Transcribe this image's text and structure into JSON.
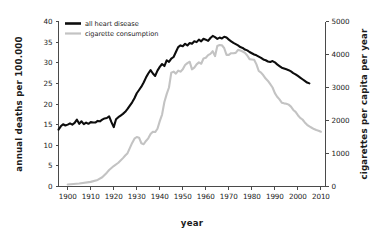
{
  "chart_data": {
    "type": "line",
    "title": "",
    "xlabel": "year",
    "ylabel": "annual deaths per 100.000",
    "y2label": "cigarettes per capita per year",
    "xlim": [
      1896,
      2012
    ],
    "ylim": [
      0,
      40
    ],
    "y2lim": [
      0,
      5000
    ],
    "grid": false,
    "legend_position": "top-left",
    "xticks": [
      "1900",
      "1910",
      "1920",
      "1930",
      "1940",
      "1950",
      "1960",
      "1970",
      "1980",
      "1990",
      "2000",
      "2010"
    ],
    "xtick_values": [
      1900,
      1910,
      1920,
      1930,
      1940,
      1950,
      1960,
      1970,
      1980,
      1990,
      2000,
      2010
    ],
    "yticks": [
      "0",
      "5",
      "10",
      "15",
      "20",
      "25",
      "30",
      "35",
      "40"
    ],
    "ytick_values": [
      0,
      5,
      10,
      15,
      20,
      25,
      30,
      35,
      40
    ],
    "y2ticks": [
      "0",
      "1000",
      "2000",
      "3000",
      "4000",
      "5000"
    ],
    "y2tick_values": [
      0,
      1000,
      2000,
      3000,
      4000,
      5000
    ],
    "series": [
      {
        "name": "all heart disease",
        "axis": "left",
        "color": "#0d0d0d",
        "x": [
          1896,
          1897,
          1898,
          1899,
          1900,
          1901,
          1902,
          1903,
          1904,
          1905,
          1906,
          1907,
          1908,
          1909,
          1910,
          1911,
          1912,
          1913,
          1914,
          1915,
          1916,
          1917,
          1918,
          1919,
          1920,
          1921,
          1922,
          1923,
          1924,
          1925,
          1926,
          1927,
          1928,
          1929,
          1930,
          1931,
          1932,
          1933,
          1934,
          1935,
          1936,
          1937,
          1938,
          1939,
          1940,
          1941,
          1942,
          1943,
          1944,
          1945,
          1946,
          1947,
          1948,
          1949,
          1950,
          1951,
          1952,
          1953,
          1954,
          1955,
          1956,
          1957,
          1958,
          1959,
          1960,
          1961,
          1962,
          1963,
          1964,
          1965,
          1966,
          1967,
          1968,
          1969,
          1970,
          1971,
          1972,
          1973,
          1974,
          1975,
          1976,
          1977,
          1978,
          1979,
          1980,
          1981,
          1982,
          1983,
          1984,
          1985,
          1986,
          1987,
          1988,
          1989,
          1990,
          1991,
          1992,
          1993,
          1994,
          1995,
          1996,
          1997,
          1998,
          1999,
          2000,
          2001,
          2002,
          2003,
          2004,
          2005
        ],
        "y": [
          13.8,
          14.6,
          15.1,
          14.8,
          15.0,
          15.3,
          15.0,
          15.4,
          16.2,
          15.2,
          15.8,
          15.1,
          15.5,
          15.2,
          15.6,
          15.5,
          15.5,
          15.9,
          15.8,
          16.2,
          16.5,
          16.6,
          17.0,
          15.6,
          14.4,
          16.3,
          16.8,
          17.2,
          17.6,
          18.1,
          18.8,
          19.6,
          20.4,
          21.4,
          22.6,
          23.4,
          24.2,
          25.2,
          26.4,
          27.4,
          28.2,
          27.4,
          26.8,
          28.1,
          29.0,
          29.7,
          29.2,
          30.6,
          30.2,
          31.0,
          31.4,
          32.6,
          33.8,
          34.2,
          34.0,
          34.6,
          34.2,
          34.8,
          34.6,
          35.2,
          35.0,
          35.6,
          35.2,
          35.8,
          35.6,
          35.3,
          36.0,
          36.5,
          36.2,
          35.8,
          36.1,
          35.9,
          36.3,
          36.1,
          35.6,
          35.2,
          34.8,
          34.5,
          34.2,
          33.8,
          33.6,
          33.2,
          33.0,
          32.6,
          32.3,
          32.0,
          31.8,
          31.5,
          31.2,
          30.8,
          30.6,
          30.3,
          30.2,
          30.4,
          30.1,
          29.6,
          29.2,
          28.8,
          28.6,
          28.4,
          28.2,
          27.9,
          27.5,
          27.2,
          26.8,
          26.4,
          26.0,
          25.6,
          25.2,
          25.0
        ]
      },
      {
        "name": "cigarette consumption",
        "axis": "right",
        "color": "#c3c3c3",
        "x": [
          1900,
          1905,
          1910,
          1913,
          1915,
          1917,
          1918,
          1920,
          1922,
          1924,
          1925,
          1926,
          1928,
          1929,
          1930,
          1931,
          1932,
          1933,
          1934,
          1935,
          1936,
          1937,
          1938,
          1939,
          1940,
          1941,
          1942,
          1943,
          1944,
          1945,
          1946,
          1947,
          1948,
          1949,
          1950,
          1951,
          1952,
          1953,
          1954,
          1955,
          1956,
          1957,
          1958,
          1959,
          1960,
          1961,
          1962,
          1963,
          1964,
          1965,
          1966,
          1967,
          1968,
          1969,
          1970,
          1971,
          1972,
          1973,
          1974,
          1975,
          1976,
          1977,
          1978,
          1979,
          1980,
          1981,
          1982,
          1983,
          1984,
          1985,
          1986,
          1987,
          1988,
          1989,
          1990,
          1991,
          1992,
          1993,
          1994,
          1995,
          1996,
          1997,
          1998,
          1999,
          2000,
          2001,
          2002,
          2003,
          2004,
          2005,
          2006,
          2007,
          2008,
          2009,
          2010
        ],
        "y": [
          60,
          90,
          140,
          200,
          280,
          420,
          500,
          620,
          720,
          860,
          940,
          1010,
          1320,
          1450,
          1500,
          1480,
          1310,
          1280,
          1380,
          1460,
          1590,
          1660,
          1650,
          1750,
          1980,
          2180,
          2560,
          2800,
          3000,
          3450,
          3480,
          3420,
          3510,
          3480,
          3550,
          3680,
          3740,
          3780,
          3550,
          3600,
          3700,
          3760,
          3720,
          3880,
          3900,
          3980,
          4020,
          4100,
          3950,
          4260,
          4290,
          4280,
          4190,
          3990,
          3990,
          4040,
          4040,
          4050,
          4140,
          4120,
          4090,
          4050,
          3970,
          3860,
          3850,
          3840,
          3700,
          3500,
          3450,
          3370,
          3270,
          3200,
          3100,
          3000,
          2830,
          2720,
          2640,
          2540,
          2520,
          2510,
          2480,
          2420,
          2320,
          2260,
          2160,
          2080,
          2030,
          1940,
          1870,
          1820,
          1780,
          1740,
          1710,
          1690,
          1660
        ]
      }
    ],
    "legend": [
      {
        "label": "all heart disease",
        "color": "#0d0d0d"
      },
      {
        "label": "cigarette consumption",
        "color": "#c3c3c3"
      }
    ],
    "axis_color": "#4a4a4a",
    "background": "#ffffff"
  }
}
